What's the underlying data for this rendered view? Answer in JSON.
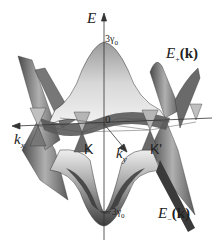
{
  "figure": {
    "axis_e": "E",
    "axis_kx": "k",
    "axis_kx_sub": "x",
    "axis_ky": "k",
    "axis_ky_sub": "y",
    "origin": "0",
    "top_tick": "3γ",
    "top_tick_sub": "0",
    "bottom_tick": "−3γ",
    "bottom_tick_sub": "0",
    "point_k": "K",
    "point_kprime": "K'",
    "upper_band_e": "E",
    "upper_band_sub": "+",
    "upper_band_k": "(k)",
    "lower_band_e": "E",
    "lower_band_sub": "−",
    "lower_band_k": "(k)"
  },
  "colors": {
    "surface_light": "#e6e6e6",
    "surface_mid": "#a8a8a8",
    "surface_dark": "#4a4a4a",
    "axis": "#333333"
  }
}
